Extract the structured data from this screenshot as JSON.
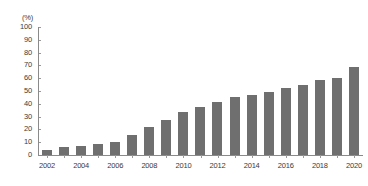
{
  "chart_data": {
    "type": "bar",
    "title": "",
    "subtitle": "",
    "xlabel": "",
    "ylabel": "",
    "unit_label": "(%)",
    "ylim": [
      0,
      100
    ],
    "ytick_values": [
      0,
      10,
      20,
      30,
      40,
      50,
      60,
      70,
      80,
      90,
      100
    ],
    "ytick_labels": [
      "0",
      "10",
      "20",
      "30",
      "40",
      "50",
      "60",
      "70",
      "80",
      "90",
      "100"
    ],
    "grid": false,
    "legend": null,
    "bar_color": "#6f6f6f",
    "axis_color": "#8a8a8a",
    "categories": [
      "2002",
      "2003",
      "2004",
      "2005",
      "2006",
      "2007",
      "2008",
      "2009",
      "2010",
      "2011",
      "2012",
      "2013",
      "2014",
      "2015",
      "2016",
      "2017",
      "2018",
      "2019",
      "2020"
    ],
    "xtick_labels_shown": [
      "2002",
      "2004",
      "2006",
      "2008",
      "2010",
      "2012",
      "2014",
      "2016",
      "2018",
      "2020"
    ],
    "values": [
      4.3,
      6.0,
      6.8,
      8.3,
      10.2,
      15.7,
      22.0,
      27.1,
      33.6,
      37.4,
      41.4,
      45.2,
      46.9,
      49.4,
      52.0,
      54.6,
      58.5,
      60.2,
      69.1
    ],
    "series": [
      {
        "name": "",
        "values": [
          4.3,
          6.0,
          6.8,
          8.3,
          10.2,
          15.7,
          22.0,
          27.1,
          33.6,
          37.4,
          41.4,
          45.2,
          46.9,
          49.4,
          52.0,
          54.6,
          58.5,
          60.2,
          69.1
        ]
      }
    ]
  }
}
